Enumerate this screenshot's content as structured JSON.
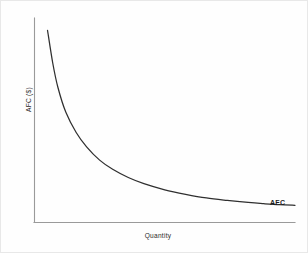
{
  "chart_data": {
    "type": "line",
    "title": "",
    "subtitle": "",
    "xlabel": "Quantity",
    "ylabel": "AFC ($)",
    "grid": false,
    "legend_position": "inline-right-end",
    "axis_ticks": {
      "x": [],
      "y": []
    },
    "xlim": [
      0,
      100
    ],
    "ylim": [
      0,
      100
    ],
    "annotations": [
      {
        "text": "AFC",
        "bold": true,
        "x": 94,
        "y": 9,
        "description": "curve label at right end of the AFC curve"
      }
    ],
    "series": [
      {
        "name": "AFC",
        "relation": "AFC = FC / Q (rectangular hyperbola, decreasing and convex)",
        "color": "#2f2f2f",
        "x": [
          5,
          7,
          9,
          12,
          16,
          20,
          25,
          30,
          36,
          42,
          50,
          58,
          66,
          74,
          82,
          88,
          94,
          100
        ],
        "y": [
          94,
          78,
          66,
          54,
          44,
          37,
          30.5,
          26,
          22,
          19,
          16,
          13.8,
          12,
          10.8,
          9.8,
          9.2,
          8.7,
          8.4
        ]
      }
    ]
  },
  "colors": {
    "background": "#fefefe",
    "frame": "#e8e8e8",
    "axis": "#9a9a9a",
    "curve": "#2f2f2f",
    "label_text": "#2b2b2b",
    "curve_label_text": "#1d1d1d"
  },
  "labels": {
    "y_axis": "AFC ($)",
    "x_axis": "Quantity",
    "curve": "AFC"
  }
}
